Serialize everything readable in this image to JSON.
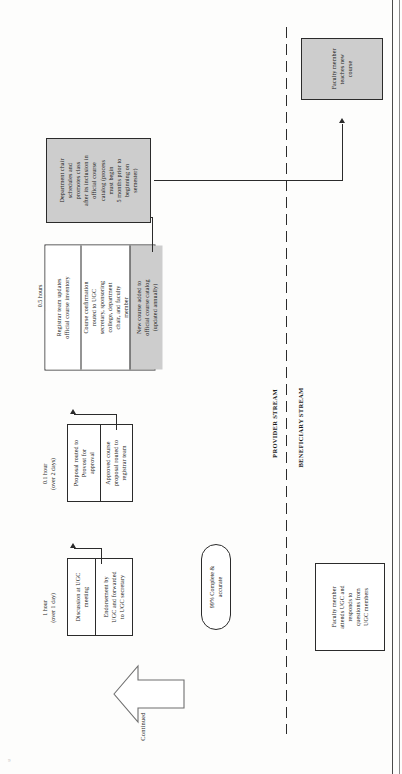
{
  "diagram": {
    "orientation": "rotated-90-ccw",
    "type": "value-stream-map",
    "stream_labels": {
      "provider": "PROVIDER STREAM",
      "beneficiary": "BENEFICIARY STREAM"
    },
    "continued_marker": "Continued",
    "corner_mark": "9"
  },
  "colors": {
    "shaded_fill": "#cdcdcd",
    "line": "#2b2b2b",
    "page": "#ffffff"
  },
  "steps": [
    {
      "id": "ugc-meeting",
      "timing": "1 hour\n(over 1 day)",
      "cells": [
        {
          "text": "Discussion at UGC\nmeeting",
          "shaded": false
        },
        {
          "text": "Endorsement by\nUGC and forwarded\nto UGC secretary",
          "shaded": false
        }
      ]
    },
    {
      "id": "provost-approval",
      "timing": "0.1 hour\n(over 2 days)",
      "cells": [
        {
          "text": "Proposal routed to\nProvost for\napproval",
          "shaded": false
        },
        {
          "text": "Approved course\nproposal routed to\nregistrar team",
          "shaded": false
        }
      ]
    },
    {
      "id": "registrar-updates",
      "timing": "0.5 hours\n(over 5 days)",
      "cells": [
        {
          "text": "Registrar team updates\nofficial course inventory",
          "shaded": false
        },
        {
          "text": "Course confirmation\nrouted to UGC\nsecretary, sponsoring\ncollege, department\nchair, and faculty\nmember",
          "shaded": false
        },
        {
          "text": "New course added to\nofficial course catalog\n(updated annually)",
          "shaded": true
        }
      ]
    },
    {
      "id": "dept-chair-schedules",
      "timing": "",
      "cells": [
        {
          "text": "Department chair\nschedules and\npromotes class\nafter its inclusion in\nofficial course\ncatalog (process\nmust begin\n5 months prior to\nbeginning on\nsemester)",
          "shaded": true
        }
      ]
    },
    {
      "id": "faculty-teaches",
      "timing": "",
      "cells": [
        {
          "text": "Faculty member\nteaches new\ncourse",
          "shaded": true
        }
      ]
    }
  ],
  "beneficiary": {
    "metric_pill": "99% Complete &\naccurate",
    "box": "Faculty member\nattends UGC and\nresponds to\nquestions from\nUGC members"
  }
}
